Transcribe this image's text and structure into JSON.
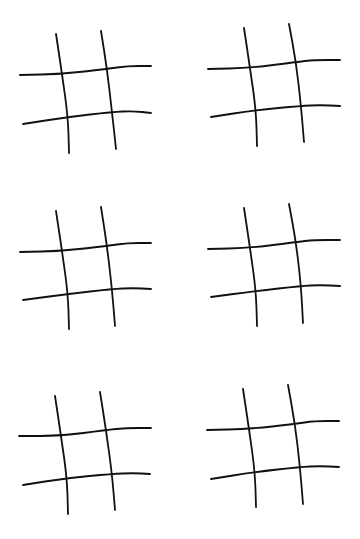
{
  "page": {
    "background": "#ffffff",
    "stroke_color": "#111111"
  },
  "grids": [
    {
      "id": "grid-1",
      "row": 1,
      "col": 1,
      "offset": [
        0,
        0
      ],
      "cells": [
        "",
        "",
        "",
        "",
        "",
        "",
        "",
        "",
        ""
      ],
      "lines": {
        "v1": [
          [
            56,
            34
          ],
          [
            62,
            74
          ],
          [
            68,
            117
          ],
          [
            69,
            153
          ]
        ],
        "v2": [
          [
            101,
            31
          ],
          [
            107,
            69
          ],
          [
            112,
            112
          ],
          [
            116,
            149
          ]
        ],
        "h1": [
          [
            20,
            75
          ],
          [
            62,
            74
          ],
          [
            107,
            69
          ],
          [
            127,
            66
          ],
          [
            151,
            66
          ]
        ],
        "h2": [
          [
            23,
            124
          ],
          [
            68,
            117
          ],
          [
            112,
            112
          ],
          [
            133,
            111
          ],
          [
            151,
            113
          ]
        ]
      }
    },
    {
      "id": "grid-2",
      "row": 1,
      "col": 2,
      "offset": [
        0,
        0
      ],
      "cells": [
        "",
        "",
        "",
        "",
        "",
        "",
        "",
        "",
        ""
      ],
      "lines": {
        "v1": [
          [
            244,
            28
          ],
          [
            250,
            68
          ],
          [
            256,
            110
          ],
          [
            257,
            146
          ]
        ],
        "v2": [
          [
            289,
            24
          ],
          [
            296,
            62
          ],
          [
            301,
            106
          ],
          [
            304,
            142
          ]
        ],
        "h1": [
          [
            208,
            69
          ],
          [
            250,
            68
          ],
          [
            296,
            62
          ],
          [
            314,
            60
          ],
          [
            340,
            60
          ]
        ],
        "h2": [
          [
            211,
            117
          ],
          [
            256,
            110
          ],
          [
            301,
            106
          ],
          [
            320,
            105
          ],
          [
            340,
            106
          ]
        ]
      }
    },
    {
      "id": "grid-3",
      "row": 2,
      "col": 1,
      "offset": [
        0,
        0
      ],
      "cells": [
        "",
        "",
        "",
        "",
        "",
        "",
        "",
        "",
        ""
      ],
      "lines": {
        "v1": [
          [
            56,
            211
          ],
          [
            62,
            251
          ],
          [
            68,
            294
          ],
          [
            69,
            329
          ]
        ],
        "v2": [
          [
            101,
            207
          ],
          [
            107,
            246
          ],
          [
            112,
            289
          ],
          [
            115,
            326
          ]
        ],
        "h1": [
          [
            20,
            252
          ],
          [
            62,
            251
          ],
          [
            107,
            246
          ],
          [
            127,
            243
          ],
          [
            151,
            243
          ]
        ],
        "h2": [
          [
            23,
            300
          ],
          [
            68,
            294
          ],
          [
            112,
            289
          ],
          [
            133,
            288
          ],
          [
            151,
            289
          ]
        ]
      }
    },
    {
      "id": "grid-4",
      "row": 2,
      "col": 2,
      "offset": [
        0,
        0
      ],
      "cells": [
        "",
        "",
        "",
        "",
        "",
        "",
        "",
        "",
        ""
      ],
      "lines": {
        "v1": [
          [
            244,
            208
          ],
          [
            250,
            248
          ],
          [
            256,
            291
          ],
          [
            257,
            326
          ]
        ],
        "v2": [
          [
            289,
            204
          ],
          [
            296,
            242
          ],
          [
            301,
            286
          ],
          [
            303,
            323
          ]
        ],
        "h1": [
          [
            208,
            249
          ],
          [
            250,
            248
          ],
          [
            296,
            242
          ],
          [
            314,
            240
          ],
          [
            340,
            240
          ]
        ],
        "h2": [
          [
            211,
            297
          ],
          [
            256,
            291
          ],
          [
            301,
            286
          ],
          [
            320,
            285
          ],
          [
            340,
            286
          ]
        ]
      }
    },
    {
      "id": "grid-5",
      "row": 3,
      "col": 1,
      "offset": [
        0,
        0
      ],
      "cells": [
        "",
        "",
        "",
        "",
        "",
        "",
        "",
        "",
        ""
      ],
      "lines": {
        "v1": [
          [
            55,
            396
          ],
          [
            61,
            436
          ],
          [
            67,
            478
          ],
          [
            68,
            514
          ]
        ],
        "v2": [
          [
            100,
            392
          ],
          [
            106,
            430
          ],
          [
            112,
            474
          ],
          [
            115,
            510
          ]
        ],
        "h1": [
          [
            19,
            436
          ],
          [
            61,
            436
          ],
          [
            106,
            430
          ],
          [
            126,
            428
          ],
          [
            151,
            428
          ]
        ],
        "h2": [
          [
            23,
            485
          ],
          [
            67,
            478
          ],
          [
            112,
            474
          ],
          [
            133,
            473
          ],
          [
            150,
            474
          ]
        ]
      }
    },
    {
      "id": "grid-6",
      "row": 3,
      "col": 2,
      "offset": [
        0,
        0
      ],
      "cells": [
        "",
        "",
        "",
        "",
        "",
        "",
        "",
        "",
        ""
      ],
      "lines": {
        "v1": [
          [
            243,
            389
          ],
          [
            249,
            429
          ],
          [
            255,
            472
          ],
          [
            256,
            507
          ]
        ],
        "v2": [
          [
            288,
            385
          ],
          [
            295,
            424
          ],
          [
            300,
            467
          ],
          [
            303,
            504
          ]
        ],
        "h1": [
          [
            207,
            430
          ],
          [
            249,
            429
          ],
          [
            295,
            424
          ],
          [
            314,
            421
          ],
          [
            339,
            421
          ]
        ],
        "h2": [
          [
            211,
            479
          ],
          [
            255,
            472
          ],
          [
            300,
            467
          ],
          [
            320,
            466
          ],
          [
            339,
            467
          ]
        ]
      }
    }
  ]
}
